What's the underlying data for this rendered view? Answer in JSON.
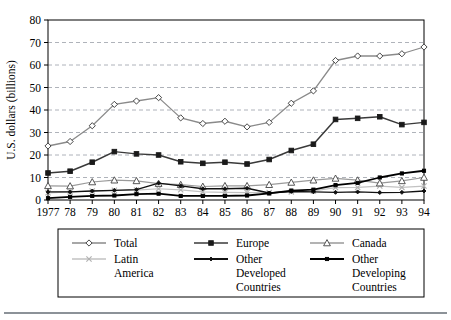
{
  "chart_data": {
    "type": "line",
    "title": "",
    "subtitle": "",
    "xlabel": "",
    "ylabel": "U.S. dollars (billions)",
    "x": [
      1977,
      1978,
      1979,
      1980,
      1981,
      1982,
      1983,
      1984,
      1985,
      1986,
      1987,
      1988,
      1989,
      1990,
      1991,
      1992,
      1993,
      1994
    ],
    "categories": [
      "1977",
      "78",
      "79",
      "80",
      "81",
      "82",
      "83",
      "84",
      "85",
      "86",
      "87",
      "88",
      "89",
      "90",
      "91",
      "92",
      "93",
      "94"
    ],
    "ylim": [
      0,
      80
    ],
    "yticks": [
      0,
      10,
      20,
      30,
      40,
      50,
      60,
      70,
      80
    ],
    "ytick_labels": [
      "0",
      "10",
      "20",
      "30",
      "40",
      "50",
      "60",
      "70",
      "80"
    ],
    "grid": true,
    "grid_axis": "y",
    "legend_position": "bottom",
    "legend_columns": 3,
    "series": [
      {
        "name": "Total",
        "marker": "diamond",
        "color": "#8a8a8a",
        "marker_fill": "#ffffff",
        "marker_stroke": "#333333",
        "line_width": 1.3,
        "values": [
          24,
          26,
          33,
          42.5,
          44,
          45.5,
          36.5,
          34,
          35,
          32.5,
          34.5,
          43,
          48.5,
          62,
          64,
          64,
          65,
          68
        ]
      },
      {
        "name": "Europe",
        "marker": "square",
        "color": "#3a3a3a",
        "marker_fill": "#1a1a1a",
        "marker_stroke": "#1a1a1a",
        "line_width": 1.5,
        "values": [
          12,
          12.8,
          16.8,
          21.5,
          20.5,
          20,
          17,
          16.3,
          16.8,
          16,
          18,
          22,
          24.8,
          35.8,
          36.3,
          37,
          33.5,
          34.5
        ]
      },
      {
        "name": "Canada",
        "marker": "triangle",
        "color": "#9a9a9a",
        "marker_fill": "#ffffff",
        "marker_stroke": "#444444",
        "line_width": 1.2,
        "values": [
          6.3,
          6.2,
          8,
          8.8,
          8.5,
          7.3,
          6.8,
          6,
          6.3,
          6.3,
          6.8,
          7.8,
          8.8,
          9.6,
          8.8,
          7.5,
          8.5,
          10
        ]
      },
      {
        "name": "Latin America",
        "marker": "x",
        "color": "#c2c2c2",
        "marker_fill": "#c2c2c2",
        "marker_stroke": "#b0b0b0",
        "line_width": 1.2,
        "values": [
          3.2,
          3.6,
          4,
          4.3,
          4.4,
          5,
          4.5,
          3.6,
          3.4,
          3.3,
          3.3,
          3.6,
          4,
          5.5,
          5.6,
          6.2,
          5.6,
          6.2
        ]
      },
      {
        "name": "Other Developed Countries",
        "marker": "diamond-small",
        "color": "#111111",
        "marker_fill": "#111111",
        "marker_stroke": "#111111",
        "line_width": 1.4,
        "values": [
          3.6,
          3.6,
          4,
          4.3,
          4.6,
          7.5,
          6.3,
          5,
          5,
          5.2,
          3.1,
          3.8,
          3.6,
          3.4,
          3.6,
          3.3,
          3.4,
          4
        ]
      },
      {
        "name": "Other Developing Countries",
        "marker": "square-small",
        "color": "#000000",
        "marker_fill": "#000000",
        "marker_stroke": "#000000",
        "line_width": 1.8,
        "values": [
          0.8,
          1.4,
          1.8,
          2,
          2.6,
          2.8,
          1.8,
          1.8,
          1.8,
          2,
          2.9,
          4.2,
          4.6,
          6.6,
          7.6,
          10,
          11.8,
          13
        ]
      }
    ],
    "legend_entries": [
      {
        "label": "Total",
        "lines": [
          "Total"
        ],
        "marker": "diamond",
        "color": "#8a8a8a",
        "marker_fill": "#ffffff",
        "marker_stroke": "#333333"
      },
      {
        "label": "Europe",
        "lines": [
          "Europe"
        ],
        "marker": "square",
        "color": "#3a3a3a",
        "marker_fill": "#1a1a1a",
        "marker_stroke": "#1a1a1a"
      },
      {
        "label": "Canada",
        "lines": [
          "Canada"
        ],
        "marker": "triangle",
        "color": "#9a9a9a",
        "marker_fill": "#ffffff",
        "marker_stroke": "#444444"
      },
      {
        "label": "Latin America",
        "lines": [
          "Latin",
          "America"
        ],
        "marker": "x",
        "color": "#c2c2c2",
        "marker_fill": "#c2c2c2",
        "marker_stroke": "#b0b0b0"
      },
      {
        "label": "Other Developed Countries",
        "lines": [
          "Other",
          "Developed",
          "Countries"
        ],
        "marker": "diamond-small",
        "color": "#111111",
        "marker_fill": "#111111",
        "marker_stroke": "#111111"
      },
      {
        "label": "Other Developing Countries",
        "lines": [
          "Other",
          "Developing",
          "Countries"
        ],
        "marker": "square-small",
        "color": "#000000",
        "marker_fill": "#000000",
        "marker_stroke": "#000000"
      }
    ]
  },
  "colors": {
    "frame": "#000000",
    "grid": "#9aa0a8",
    "background": "#ffffff",
    "bottom_rule": "#8c9298"
  }
}
